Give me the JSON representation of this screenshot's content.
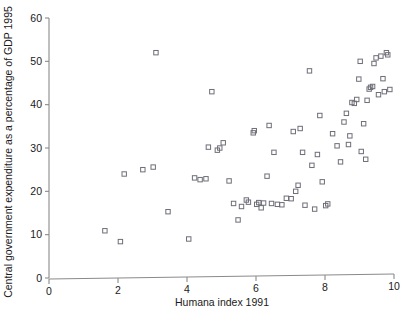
{
  "chart_data": {
    "type": "scatter",
    "title": "",
    "xlabel": "Humana index 1991",
    "ylabel": "Central government expenditure as a percentage of GDP 1995",
    "xlim": [
      0,
      10
    ],
    "ylim": [
      0,
      60
    ],
    "xticks": [
      0,
      2,
      4,
      6,
      8,
      10
    ],
    "yticks": [
      0,
      10,
      20,
      30,
      40,
      50,
      60
    ],
    "xtick_labels": [
      "0",
      "2",
      "4",
      "6",
      "8",
      "10"
    ],
    "ytick_labels": [
      "0",
      "10",
      "20",
      "30",
      "40",
      "50",
      "60"
    ],
    "grid": false,
    "legend": null,
    "marker": "open-square",
    "marker_color": "#6e6e78",
    "series": [
      {
        "name": "countries",
        "points": [
          [
            1.62,
            10.9
          ],
          [
            2.07,
            8.4
          ],
          [
            2.18,
            24.0
          ],
          [
            2.72,
            25.0
          ],
          [
            3.02,
            25.6
          ],
          [
            3.1,
            52.0
          ],
          [
            3.45,
            15.3
          ],
          [
            4.05,
            9.0
          ],
          [
            4.22,
            23.1
          ],
          [
            4.38,
            22.7
          ],
          [
            4.55,
            22.9
          ],
          [
            4.62,
            30.2
          ],
          [
            4.72,
            43.0
          ],
          [
            4.88,
            29.5
          ],
          [
            4.95,
            30.0
          ],
          [
            5.05,
            31.2
          ],
          [
            5.22,
            22.4
          ],
          [
            5.35,
            17.2
          ],
          [
            5.48,
            13.4
          ],
          [
            5.58,
            16.5
          ],
          [
            5.72,
            18.0
          ],
          [
            5.78,
            17.5
          ],
          [
            5.92,
            33.5
          ],
          [
            5.95,
            34.0
          ],
          [
            6.02,
            17.0
          ],
          [
            6.08,
            17.4
          ],
          [
            6.15,
            16.2
          ],
          [
            6.22,
            17.3
          ],
          [
            6.32,
            23.5
          ],
          [
            6.38,
            35.2
          ],
          [
            6.45,
            17.2
          ],
          [
            6.52,
            29.0
          ],
          [
            6.62,
            17.0
          ],
          [
            6.75,
            16.9
          ],
          [
            6.88,
            18.4
          ],
          [
            7.02,
            18.3
          ],
          [
            7.08,
            33.8
          ],
          [
            7.15,
            20.0
          ],
          [
            7.22,
            21.4
          ],
          [
            7.28,
            34.5
          ],
          [
            7.35,
            29.0
          ],
          [
            7.42,
            16.8
          ],
          [
            7.55,
            47.8
          ],
          [
            7.62,
            26.0
          ],
          [
            7.7,
            15.9
          ],
          [
            7.78,
            28.5
          ],
          [
            7.85,
            37.5
          ],
          [
            7.92,
            22.2
          ],
          [
            8.02,
            16.7
          ],
          [
            8.08,
            17.1
          ],
          [
            8.22,
            33.3
          ],
          [
            8.35,
            30.5
          ],
          [
            8.45,
            26.8
          ],
          [
            8.55,
            36.0
          ],
          [
            8.62,
            38.0
          ],
          [
            8.68,
            30.8
          ],
          [
            8.72,
            32.8
          ],
          [
            8.78,
            40.5
          ],
          [
            8.85,
            40.3
          ],
          [
            8.92,
            41.2
          ],
          [
            8.98,
            45.9
          ],
          [
            9.02,
            50.0
          ],
          [
            9.05,
            29.2
          ],
          [
            9.12,
            35.6
          ],
          [
            9.18,
            27.4
          ],
          [
            9.22,
            41.0
          ],
          [
            9.28,
            43.6
          ],
          [
            9.32,
            44.0
          ],
          [
            9.38,
            44.2
          ],
          [
            9.42,
            49.5
          ],
          [
            9.48,
            50.8
          ],
          [
            9.55,
            42.3
          ],
          [
            9.62,
            51.2
          ],
          [
            9.68,
            46.0
          ],
          [
            9.72,
            43.0
          ],
          [
            9.78,
            52.0
          ],
          [
            9.82,
            51.5
          ],
          [
            9.88,
            43.5
          ]
        ]
      }
    ]
  },
  "axes": {
    "x_axis_name": "x-axis",
    "y_axis_name": "y-axis"
  }
}
